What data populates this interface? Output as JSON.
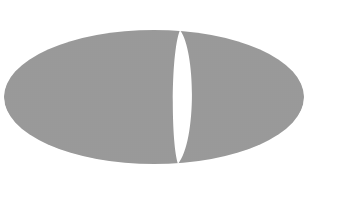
{
  "canvas": {
    "width": 337,
    "height": 203,
    "background_color": "#ffffff",
    "title": ""
  },
  "figure": {
    "name": "split-ellipse",
    "description": "Gray textured ellipse divided by a white lens-shaped gap into a large left lobe and a smaller right lobe",
    "fill_color": "#9a9a9a",
    "gap_color": "#ffffff",
    "texture": {
      "type": "crosshatch-grid",
      "pitch_px": 2,
      "line_color": "#8e8e8e",
      "opacity": 0.35
    },
    "ellipse": {
      "cx": 154,
      "cy": 97,
      "rx": 150,
      "ry": 67,
      "left_edge_x": 4,
      "right_edge_x": 304,
      "top_edge_y": 30,
      "bottom_edge_y": 164
    },
    "gap": {
      "shape": "lens",
      "top_x": 180,
      "top_y": 30,
      "bottom_x": 178,
      "bottom_y": 164,
      "widest_y": 97,
      "widest_left_x": 174,
      "widest_right_x": 193,
      "max_width_px": 19
    },
    "lobes": [
      {
        "name": "left-lobe",
        "side": "left",
        "relative_area": "large",
        "inner_border": "convex"
      },
      {
        "name": "right-lobe",
        "side": "right",
        "relative_area": "small",
        "inner_border": "concave"
      }
    ]
  }
}
